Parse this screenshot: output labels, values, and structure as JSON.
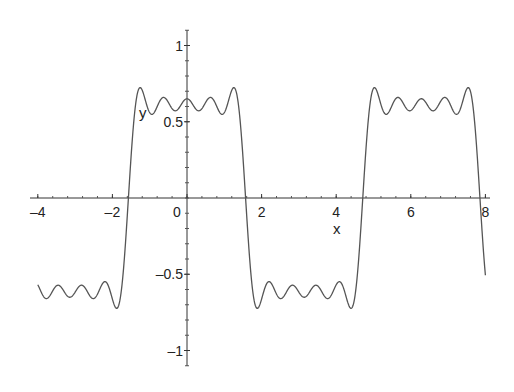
{
  "chart_data": {
    "type": "line",
    "title": "",
    "xlabel": "x",
    "ylabel": "y",
    "xlim": [
      -4,
      8
    ],
    "ylim": [
      -1.1,
      1.1
    ],
    "grid": false,
    "legend": null,
    "x_ticks": [
      -4,
      -2,
      0,
      2,
      4,
      6,
      8
    ],
    "x_tick_labels": [
      "–4",
      "–2",
      "0",
      "2",
      "4",
      "6",
      "8"
    ],
    "y_ticks": [
      1,
      0.5,
      -0.5,
      -1
    ],
    "y_tick_labels": [
      "1",
      "0.5",
      "–0.5",
      "–1"
    ],
    "series": [
      {
        "name": "y",
        "description": "Partial Fourier sum of a square wave (period 2π), ~5 odd cosine terms, scaled so plateaus ≈ ±0.8 with Gibbs overshoot ≈ ±0.93",
        "formula_terms": [
          1,
          -0.3333,
          0.2,
          -0.1429,
          0.1111
        ],
        "scale": 0.785,
        "sample_points": [
          {
            "x": -4,
            "y": -0.76
          },
          {
            "x": -3.14,
            "y": -0.72
          },
          {
            "x": -2.3,
            "y": -0.92
          },
          {
            "x": -1.57,
            "y": 0.0
          },
          {
            "x": -1.25,
            "y": 0.93
          },
          {
            "x": -0.9,
            "y": 0.72
          },
          {
            "x": 0,
            "y": 0.82
          },
          {
            "x": 0.9,
            "y": 0.72
          },
          {
            "x": 1.25,
            "y": 0.93
          },
          {
            "x": 1.57,
            "y": 0.0
          },
          {
            "x": 1.9,
            "y": -0.93
          },
          {
            "x": 3.14,
            "y": -0.82
          },
          {
            "x": 4.4,
            "y": -0.93
          },
          {
            "x": 4.71,
            "y": 0.0
          },
          {
            "x": 5.0,
            "y": 0.93
          },
          {
            "x": 6.28,
            "y": 0.82
          },
          {
            "x": 7.55,
            "y": 0.93
          },
          {
            "x": 7.85,
            "y": 0.0
          },
          {
            "x": 8,
            "y": -0.65
          }
        ],
        "color": "#555555"
      }
    ]
  },
  "axes": {
    "x_label": "x",
    "y_label": "y"
  }
}
